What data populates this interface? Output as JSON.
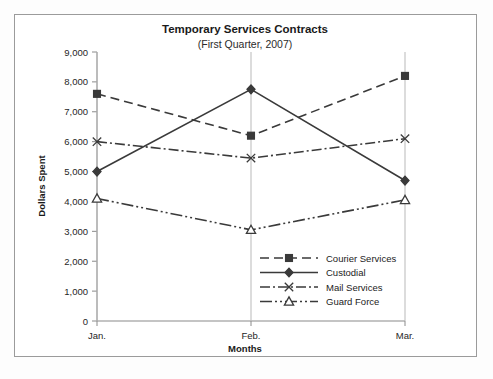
{
  "chart_data": {
    "type": "line",
    "title": "Temporary Services Contracts",
    "subtitle": "(First Quarter, 2007)",
    "xlabel": "Months",
    "ylabel": "Dollars Spent",
    "categories": [
      "Jan.",
      "Feb.",
      "Mar."
    ],
    "ylim": [
      0,
      9000
    ],
    "ytick_step": 1000,
    "ytick_labels": [
      "0",
      "1,000",
      "2,000",
      "3,000",
      "4,000",
      "5,000",
      "6,000",
      "7,000",
      "8,000",
      "9,000"
    ],
    "grid": false,
    "legend_position": "inside-lower-right",
    "series": [
      {
        "name": "Courier Services",
        "values": [
          7600,
          6200,
          8200
        ],
        "marker": "square",
        "dash": "9,5",
        "color": "#3a3a3a"
      },
      {
        "name": "Custodial",
        "values": [
          5000,
          7750,
          4700
        ],
        "marker": "diamond",
        "dash": "none",
        "color": "#3a3a3a"
      },
      {
        "name": "Mail Services",
        "values": [
          6000,
          5450,
          6100
        ],
        "marker": "x",
        "dash": "10,3,2,3",
        "color": "#3a3a3a"
      },
      {
        "name": "Guard Force",
        "values": [
          4100,
          3050,
          4050
        ],
        "marker": "triangle",
        "dash": "12,3,2,3,2,3",
        "color": "#3a3a3a"
      }
    ]
  }
}
